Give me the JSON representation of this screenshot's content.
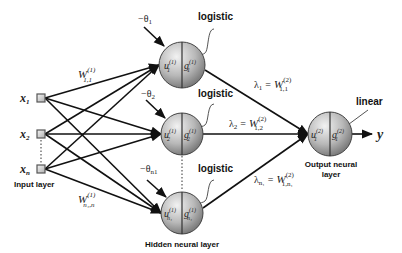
{
  "diagram": {
    "type": "neural-network-architecture",
    "inputs": [
      {
        "id": "x1",
        "label": "x",
        "sub": "1",
        "cx": 41,
        "cy": 98
      },
      {
        "id": "x2",
        "label": "x",
        "sub": "2",
        "cx": 41,
        "cy": 134
      },
      {
        "id": "xn",
        "label": "x",
        "sub": "n",
        "cx": 41,
        "cy": 169
      }
    ],
    "input_layer_label": "Input layer",
    "hidden": [
      {
        "id": "h1",
        "cx": 182,
        "cy": 65,
        "r": 23,
        "u": "u",
        "u_sup": "(1)",
        "u_sub": "1",
        "g": "g",
        "g_sup": "(1)",
        "g_sub": "1",
        "theta": "−θ",
        "theta_sub": "1",
        "activation": "logistic",
        "lambda": "λ",
        "lambda_sub": "1",
        "weight": "W",
        "weight_sup": "(2)",
        "weight_sub": "1,1"
      },
      {
        "id": "h2",
        "cx": 182,
        "cy": 134,
        "r": 21,
        "u": "u",
        "u_sup": "(1)",
        "u_sub": "2",
        "g": "g",
        "g_sup": "(1)",
        "g_sub": "2",
        "theta": "−θ",
        "theta_sub": "2",
        "activation": "logistic",
        "lambda": "λ",
        "lambda_sub": "2",
        "weight": "W",
        "weight_sup": "(2)",
        "weight_sub": "1,2"
      },
      {
        "id": "hn",
        "cx": 182,
        "cy": 213,
        "r": 21,
        "u": "u",
        "u_sup": "(1)",
        "u_sub": "n₁",
        "g": "g",
        "g_sup": "(1)",
        "g_sub": "n₁",
        "theta": "−θ",
        "theta_sub": "n1",
        "activation": "logistic",
        "lambda": "λ",
        "lambda_sub": "n₁",
        "weight": "W",
        "weight_sup": "(2)",
        "weight_sub": "1,n₁"
      }
    ],
    "hidden_layer_label": "Hidden neural layer",
    "input_weights": [
      {
        "label": "W",
        "sup": "(1)",
        "sub": "1,1"
      },
      {
        "label": "W",
        "sup": "(1)",
        "sub": "n₁,n"
      }
    ],
    "output": {
      "cx": 330,
      "cy": 134,
      "r": 22,
      "u": "u",
      "u_sup": "(2)",
      "u_sub": "1",
      "g": "g",
      "g_sup": "(2)",
      "g_sub": "1",
      "activation": "linear",
      "y": "y"
    },
    "output_layer_label_1": "Output neural",
    "output_layer_label_2": "layer",
    "equals": "="
  }
}
